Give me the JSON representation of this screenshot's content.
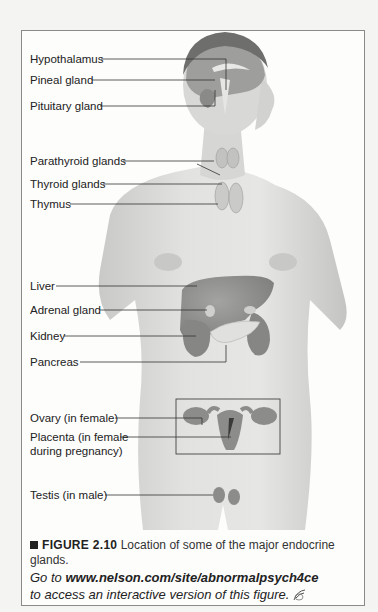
{
  "figure": {
    "labels": [
      {
        "id": "hypothalamus",
        "text": "Hypothalamus"
      },
      {
        "id": "pineal",
        "text": "Pineal gland"
      },
      {
        "id": "pituitary",
        "text": "Pituitary gland"
      },
      {
        "id": "parathyroid",
        "text": "Parathyroid glands"
      },
      {
        "id": "thyroid",
        "text": "Thyroid glands"
      },
      {
        "id": "thymus",
        "text": "Thymus"
      },
      {
        "id": "liver",
        "text": "Liver"
      },
      {
        "id": "adrenal",
        "text": "Adrenal gland"
      },
      {
        "id": "kidney",
        "text": "Kidney"
      },
      {
        "id": "pancreas",
        "text": "Pancreas"
      },
      {
        "id": "ovary",
        "text": "Ovary (in female)"
      },
      {
        "id": "placenta_1",
        "text": "Placenta (in female"
      },
      {
        "id": "placenta_2",
        "text": "during pregnancy)"
      },
      {
        "id": "testis",
        "text": "Testis (in male)"
      }
    ],
    "caption": {
      "number": "FIGURE 2.10",
      "text": "Location of some of the major endocrine glands."
    },
    "link": {
      "prefix": "Go to ",
      "url": "www.nelson.com/site/abnormalpsych4ce",
      "suffix": "to access an interactive version of this figure."
    },
    "colors": {
      "skin": "#dcdcda",
      "skin_shadow": "#b8b8b6",
      "organ": "#8d8d8b",
      "organ_light": "#a9a9a7",
      "line": "#333333",
      "frame": "#8a8a8a"
    }
  }
}
